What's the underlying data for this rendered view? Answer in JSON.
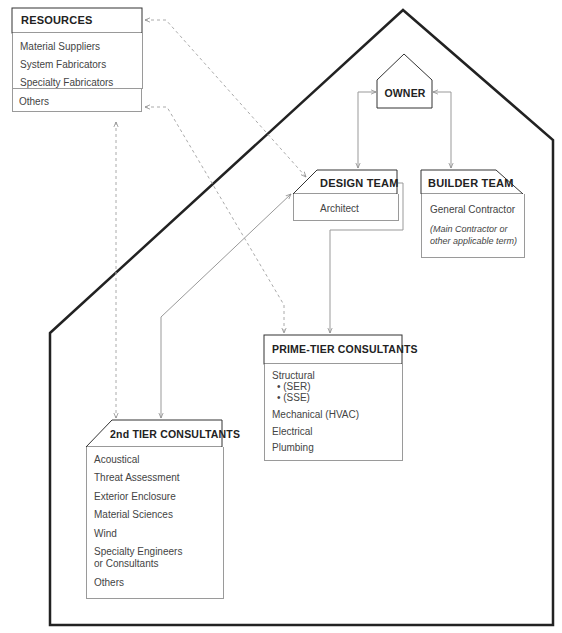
{
  "diagram": {
    "colors": {
      "house_outline": "#222222",
      "box_header_border": "#333333",
      "box_body_border": "#9a9a9a",
      "connector_solid": "#999999",
      "connector_dashed": "#aaaaaa",
      "text": "#444444"
    },
    "nodes": {
      "owner": {
        "title": "OWNER"
      },
      "resources": {
        "title": "RESOURCES",
        "items": [
          "Material Suppliers",
          "System Fabricators",
          "Specialty Fabricators",
          "Others"
        ]
      },
      "design_team": {
        "title": "DESIGN TEAM",
        "items": [
          "Architect"
        ]
      },
      "builder_team": {
        "title": "BUILDER TEAM",
        "items": [
          "General Contractor"
        ],
        "note": [
          "(Main Contractor or",
          "other applicable term)"
        ]
      },
      "prime_tier": {
        "title": "PRIME-TIER CONSULTANTS",
        "items": [
          "Structural",
          "• (SER)",
          "• (SSE)",
          "Mechanical (HVAC)",
          "Electrical",
          "Plumbing"
        ]
      },
      "second_tier": {
        "title": "2nd TIER CONSULTANTS",
        "items": [
          "Acoustical",
          "Threat Assessment",
          "Exterior Enclosure",
          "Material Sciences",
          "Wind",
          "Specialty Engineers",
          "or Consultants",
          "Others"
        ]
      }
    },
    "connections": [
      {
        "from": "owner",
        "to": "design_team",
        "style": "solid",
        "arrows": "both"
      },
      {
        "from": "owner",
        "to": "builder_team",
        "style": "solid",
        "arrows": "both"
      },
      {
        "from": "design_team",
        "to": "prime_tier",
        "style": "solid",
        "arrows": "end"
      },
      {
        "from": "design_team",
        "to": "second_tier",
        "style": "solid",
        "arrows": "both"
      },
      {
        "from": "resources",
        "to": "design_team",
        "style": "dashed",
        "arrows": "both"
      },
      {
        "from": "resources",
        "to": "prime_tier",
        "style": "dashed",
        "arrows": "both"
      },
      {
        "from": "resources",
        "to": "second_tier",
        "style": "dashed",
        "arrows": "both"
      }
    ]
  }
}
